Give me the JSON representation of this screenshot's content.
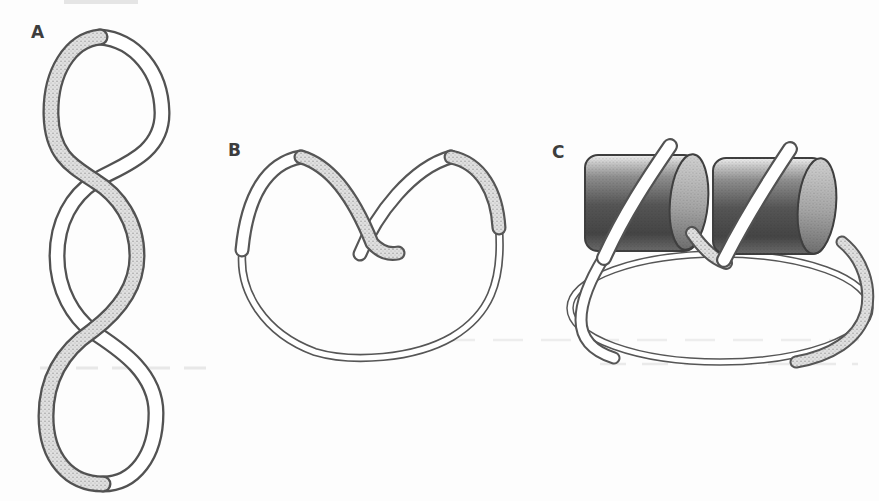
{
  "figure": {
    "panels": [
      {
        "label": "A",
        "name": "plectonemic-supercoiled-ribbon"
      },
      {
        "label": "B",
        "name": "folded-ribbon-loop"
      },
      {
        "label": "C",
        "name": "ribbon-wrapped-around-two-cylinders"
      }
    ],
    "colors": {
      "paper": "#fdfdfd",
      "ink_outline": "#525252",
      "ribbon_face_white": "#ffffff",
      "ribbon_face_stipple": "#e0e0e0",
      "cylinder_dark": "#4a4a4a",
      "label_text": "#3d3d3d"
    }
  }
}
